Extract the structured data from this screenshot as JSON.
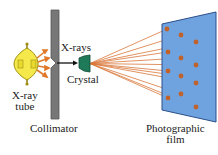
{
  "diagram": {
    "type": "x-ray diffraction setup (Laue method)",
    "labels": {
      "xray_tube": [
        "X-ray",
        "tube"
      ],
      "collimator": "Collimator",
      "xrays": "X-rays",
      "crystal": "Crystal",
      "film": [
        "Photographic",
        "film"
      ]
    },
    "colors": {
      "tube_glass": "#f4e84a",
      "rays_short": "#e0782a",
      "collimator": "#777777",
      "crystal": "#1f7a5a",
      "diffracted_rays": "#d9773a",
      "film": "#6fa3e0",
      "film_edge": "#2a4f8a",
      "spots": "#c0622a"
    },
    "film_spots": [
      [
        167,
        29
      ],
      [
        181,
        35
      ],
      [
        196,
        42
      ],
      [
        168,
        52
      ],
      [
        181,
        58
      ],
      [
        196,
        65
      ],
      [
        168,
        71
      ],
      [
        181,
        76
      ],
      [
        196,
        83
      ],
      [
        168,
        98
      ],
      [
        181,
        94
      ],
      [
        196,
        107
      ]
    ]
  }
}
